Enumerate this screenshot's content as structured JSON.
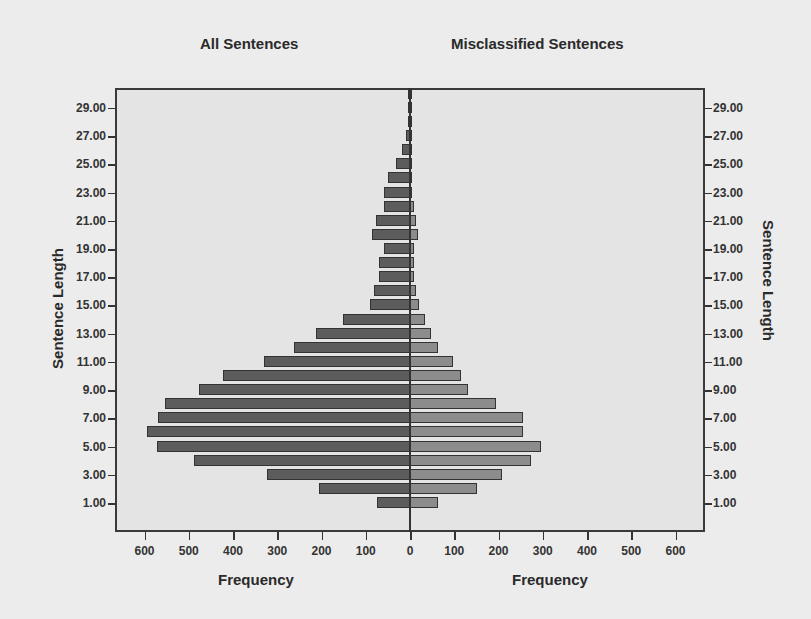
{
  "chart_data": {
    "type": "bar",
    "orientation": "horizontal",
    "layout": "back-to-back population pyramid",
    "panels": [
      {
        "title": "All Sentences",
        "side": "left",
        "xlabel": "Frequency",
        "color": "#5c5c5c"
      },
      {
        "title": "Misclassified Sentences",
        "side": "right",
        "xlabel": "Frequency",
        "color": "#8c8c8c"
      }
    ],
    "ylabel": "Sentence Length",
    "y_tick_labels": [
      "1.00",
      "3.00",
      "5.00",
      "7.00",
      "9.00",
      "11.00",
      "13.00",
      "15.00",
      "17.00",
      "19.00",
      "21.00",
      "23.00",
      "25.00",
      "27.00",
      "29.00"
    ],
    "x_tick_labels_left": [
      "600",
      "500",
      "400",
      "300",
      "200",
      "100",
      "0"
    ],
    "x_tick_labels_right": [
      "0",
      "100",
      "200",
      "300",
      "400",
      "500",
      "600"
    ],
    "xlim": [
      0,
      600
    ],
    "ylim": [
      0,
      31
    ],
    "grid": false,
    "categories": [
      1,
      2,
      3,
      4,
      5,
      6,
      7,
      8,
      9,
      10,
      11,
      12,
      13,
      14,
      15,
      16,
      17,
      18,
      19,
      20,
      21,
      22,
      23,
      24,
      25,
      26,
      27,
      28,
      29,
      30
    ],
    "series": [
      {
        "name": "All Sentences",
        "values": [
          74,
          205,
          323,
          488,
          571,
          594,
          569,
          553,
          476,
          422,
          330,
          262,
          212,
          152,
          91,
          82,
          71,
          69,
          58,
          87,
          76,
          58,
          58,
          49,
          31,
          19,
          10,
          4,
          3,
          2
        ]
      },
      {
        "name": "Misclassified Sentences",
        "values": [
          64,
          152,
          208,
          274,
          297,
          256,
          256,
          195,
          130,
          116,
          98,
          64,
          48,
          35,
          20,
          14,
          10,
          8,
          10,
          17,
          14,
          10,
          5,
          4,
          3,
          2,
          2,
          1,
          1,
          1
        ]
      }
    ]
  },
  "titles": {
    "left": "All Sentences",
    "right": "Misclassified Sentences"
  },
  "axes": {
    "left_y": "Sentence Length",
    "right_y": "Sentence Length",
    "left_x": "Frequency",
    "right_x": "Frequency"
  }
}
